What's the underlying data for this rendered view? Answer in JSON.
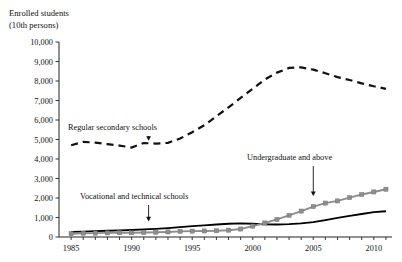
{
  "chart_data": {
    "type": "line",
    "title": "Enrolled students",
    "subtitle": "(10th persons)",
    "ylabel": "Enrolled students (10th persons)",
    "xlabel": "",
    "ylim": [
      0,
      10000
    ],
    "xlim": [
      1984,
      2011.5
    ],
    "ytick_labels": [
      "0",
      "1,000",
      "2,000",
      "3,000",
      "4,000",
      "5,000",
      "6,000",
      "7,000",
      "8,000",
      "9,000",
      "10,000"
    ],
    "ytick_values": [
      0,
      1000,
      2000,
      3000,
      4000,
      5000,
      6000,
      7000,
      8000,
      9000,
      10000
    ],
    "xtick_labels": [
      "1985",
      "1990",
      "1995",
      "2000",
      "2005",
      "2010"
    ],
    "xtick_values": [
      1985,
      1990,
      1995,
      2000,
      2005,
      2010
    ],
    "grid": false,
    "legend": "none",
    "x": [
      1985,
      1986,
      1987,
      1988,
      1989,
      1990,
      1991,
      1992,
      1993,
      1994,
      1995,
      1996,
      1997,
      1998,
      1999,
      2000,
      2001,
      2002,
      2003,
      2004,
      2005,
      2006,
      2007,
      2008,
      2009,
      2010,
      2011
    ],
    "series": [
      {
        "name": "Regular secondary schools",
        "style": "dashed",
        "color": "#111111",
        "values": [
          4706,
          4880,
          4840,
          4760,
          4690,
          4586,
          4820,
          4790,
          4830,
          5050,
          5370,
          5730,
          6190,
          6650,
          7130,
          7600,
          8080,
          8430,
          8670,
          8700,
          8580,
          8400,
          8200,
          8050,
          7880,
          7730,
          7600
        ]
      },
      {
        "name": "Vocational and technical schools",
        "style": "solid",
        "color": "#000000",
        "values": [
          260,
          280,
          300,
          320,
          340,
          360,
          390,
          420,
          460,
          510,
          560,
          600,
          640,
          680,
          700,
          680,
          650,
          640,
          660,
          700,
          760,
          870,
          980,
          1080,
          1180,
          1280,
          1320
        ]
      },
      {
        "name": "Undergraduate and above",
        "style": "marker",
        "color": "#8d8d8d",
        "values": [
          170,
          190,
          200,
          210,
          220,
          220,
          230,
          240,
          260,
          290,
          300,
          310,
          320,
          350,
          410,
          560,
          720,
          900,
          1110,
          1330,
          1560,
          1740,
          1850,
          2020,
          2180,
          2310,
          2450
        ]
      }
    ],
    "annotations": [
      {
        "label": "Regular secondary schools",
        "target_x": 1991.4,
        "target_y": 4790
      },
      {
        "label": "Vocational and technical schools",
        "target_x": 1991.4,
        "target_y": 400
      },
      {
        "label": "Undergraduate and above",
        "target_x": 2005.0,
        "target_y": 1960
      }
    ]
  }
}
